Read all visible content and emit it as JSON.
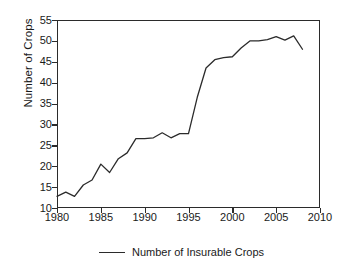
{
  "chart_data": {
    "type": "line",
    "title": "",
    "xlabel": "",
    "ylabel": "Number of Crops",
    "xlim": [
      1980,
      2010
    ],
    "ylim": [
      10,
      55
    ],
    "xticks": [
      1980,
      1985,
      1990,
      1995,
      2000,
      2005,
      2010
    ],
    "yticks": [
      10,
      15,
      20,
      25,
      30,
      35,
      40,
      45,
      50,
      55
    ],
    "grid": false,
    "legend_position": "bottom-center",
    "line_color": "#2b2b2b",
    "x": [
      1980,
      1981,
      1982,
      1983,
      1984,
      1985,
      1986,
      1987,
      1988,
      1989,
      1990,
      1991,
      1992,
      1993,
      1994,
      1995,
      1996,
      1997,
      1998,
      1999,
      2000,
      2001,
      2002,
      2003,
      2004,
      2005,
      2006,
      2007,
      2008
    ],
    "series": [
      {
        "name": "Number of Insurable Crops",
        "values": [
          12.8,
          13.8,
          12.8,
          15.5,
          16.7,
          20.5,
          18.5,
          21.8,
          23.2,
          26.6,
          26.6,
          26.8,
          28.0,
          26.8,
          27.8,
          27.8,
          36.5,
          43.5,
          45.5,
          46.0,
          46.2,
          48.3,
          50.0,
          50.0,
          50.3,
          51.0,
          50.2,
          51.2,
          48.0
        ]
      }
    ]
  },
  "legend": {
    "entries": [
      {
        "label": "Number of Insurable Crops"
      }
    ]
  },
  "axes": {
    "ylabel": "Number of Crops",
    "ytick_labels": [
      "55",
      "50",
      "45",
      "40",
      "35",
      "30",
      "25",
      "20",
      "15",
      "10"
    ],
    "xtick_labels": [
      "1980",
      "1985",
      "1990",
      "1995",
      "2000",
      "2005",
      "2010"
    ]
  }
}
